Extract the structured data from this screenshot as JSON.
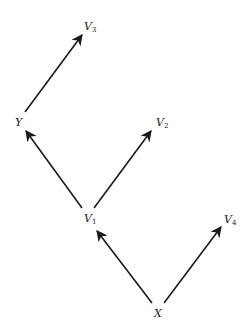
{
  "diagram": {
    "type": "directed-graph",
    "nodes": [
      {
        "id": "V3",
        "label": "V",
        "subscript": "3",
        "x": 84,
        "y": 21
      },
      {
        "id": "Y",
        "label": "Y",
        "subscript": "",
        "x": 15,
        "y": 117
      },
      {
        "id": "V2",
        "label": "V",
        "subscript": "2",
        "x": 156,
        "y": 117
      },
      {
        "id": "V1",
        "label": "V",
        "subscript": "1",
        "x": 84,
        "y": 213
      },
      {
        "id": "V4",
        "label": "V",
        "subscript": "4",
        "x": 224,
        "y": 214
      },
      {
        "id": "X",
        "label": "X",
        "subscript": "",
        "x": 154,
        "y": 308
      }
    ],
    "edges": [
      {
        "from": "Y",
        "to": "V3",
        "x1": 25,
        "y1": 112,
        "x2": 82,
        "y2": 35
      },
      {
        "from": "V1",
        "to": "Y",
        "x1": 82,
        "y1": 208,
        "x2": 26,
        "y2": 131
      },
      {
        "from": "V1",
        "to": "V2",
        "x1": 94,
        "y1": 208,
        "x2": 151,
        "y2": 131
      },
      {
        "from": "X",
        "to": "V1",
        "x1": 152,
        "y1": 303,
        "x2": 97,
        "y2": 231
      },
      {
        "from": "X",
        "to": "V4",
        "x1": 164,
        "y1": 303,
        "x2": 221,
        "y2": 227
      }
    ],
    "colors": {
      "stroke": "#1a1a1a",
      "background": "#ffffff"
    }
  }
}
